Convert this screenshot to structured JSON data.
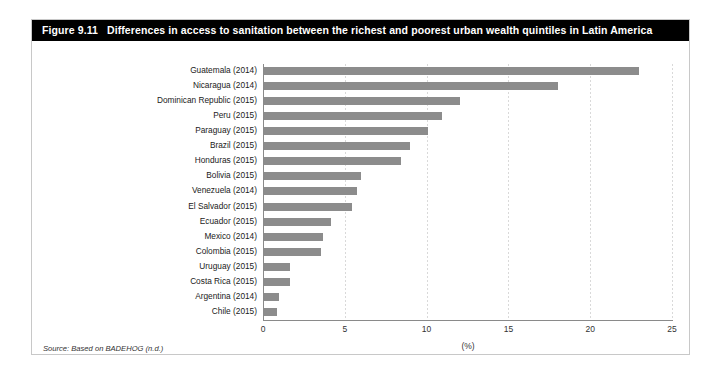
{
  "figure": {
    "number": "Figure 9.11",
    "title": "Differences in access to sanitation between the richest and poorest urban wealth quintiles in Latin America",
    "source_note": "Source: Based on BADEHOG (n.d.)",
    "frame_color": "#c8c8c8",
    "title_bar_color": "#000000",
    "title_text_color": "#ffffff",
    "bar_color": "#8c8c8c",
    "axis_color": "#8a8a8a",
    "gridline_color": "#d9d9d9"
  },
  "chart_data": {
    "type": "bar",
    "orientation": "horizontal",
    "title": "Differences in access to sanitation between the richest and poorest urban wealth quintiles in Latin America",
    "xlabel": "(%)",
    "ylabel": "",
    "xlim": [
      0,
      25
    ],
    "xticks": [
      0,
      5,
      10,
      15,
      20,
      25
    ],
    "xtick_labels": [
      "0",
      "5",
      "10",
      "15",
      "20",
      "25"
    ],
    "grid": true,
    "grid_axis": "x",
    "legend": false,
    "categories": [
      "Guatemala (2014)",
      "Nicaragua (2014)",
      "Dominican Republic (2015)",
      "Peru (2015)",
      "Paraguay (2015)",
      "Brazil (2015)",
      "Honduras (2015)",
      "Bolivia (2015)",
      "Venezuela (2014)",
      "El Salvador (2015)",
      "Ecuador (2015)",
      "Mexico (2014)",
      "Colombia (2015)",
      "Uruguay (2015)",
      "Costa Rica (2015)",
      "Argentina (2014)",
      "Chile (2015)"
    ],
    "values": [
      22.9,
      18.0,
      12.0,
      10.9,
      10.0,
      8.9,
      8.4,
      5.9,
      5.7,
      5.4,
      4.1,
      3.6,
      3.5,
      1.6,
      1.6,
      0.9,
      0.8
    ]
  }
}
